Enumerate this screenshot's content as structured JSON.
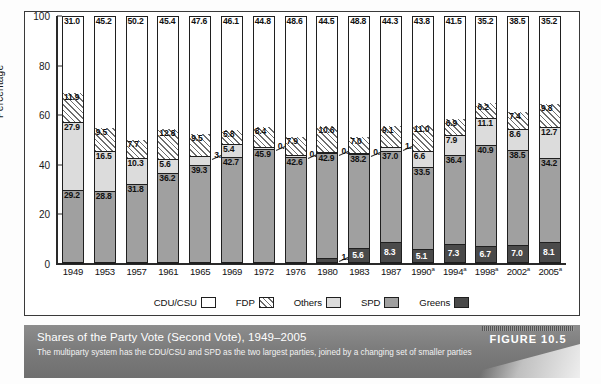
{
  "figure": {
    "tag": "FIGURE 10.5",
    "title": "Shares of the Party Vote (Second Vote), 1949–2005",
    "subtitle": "The multiparty system has the CDU/CSU and SPD as the two largest parties, joined by a changing set of smaller parties"
  },
  "axes": {
    "ylabel": "Percentage",
    "yticks": [
      "100",
      "80",
      "60",
      "40",
      "20",
      "0"
    ]
  },
  "legend": [
    {
      "label": "CDU/CSU",
      "key": "cdu",
      "color": "#ffffff"
    },
    {
      "label": "FDP",
      "key": "fdp",
      "color": "#ffffff"
    },
    {
      "label": "Others",
      "key": "others",
      "color": "#dcdcdc"
    },
    {
      "label": "SPD",
      "key": "spd",
      "color": "#a0a0a0"
    },
    {
      "label": "Greens",
      "key": "greens",
      "color": "#4a4a4a"
    }
  ],
  "chart_data": {
    "type": "bar",
    "subtype": "stacked-vertical-100",
    "title": "Shares of the Party Vote (Second Vote), 1949–2005",
    "xlabel": "",
    "ylabel": "Percentage",
    "ylim": [
      0,
      100
    ],
    "ytick_step": 20,
    "grid": false,
    "legend_position": "bottom",
    "footnote_marker": "a",
    "categories": [
      "1949",
      "1953",
      "1957",
      "1961",
      "1965",
      "1969",
      "1972",
      "1976",
      "1980",
      "1983",
      "1987",
      "1990",
      "1994",
      "1998",
      "2002",
      "2005"
    ],
    "categories_display": [
      "1949",
      "1953",
      "1957",
      "1961",
      "1965",
      "1969",
      "1972",
      "1976",
      "1980",
      "1983",
      "1987",
      "1990a",
      "1994a",
      "1998a",
      "2002a",
      "2005a"
    ],
    "stack_order_bottom_to_top": [
      "Greens",
      "SPD",
      "Others",
      "FDP",
      "CDU/CSU"
    ],
    "series": [
      {
        "name": "Greens",
        "values": [
          null,
          null,
          null,
          null,
          null,
          null,
          null,
          null,
          1.5,
          5.6,
          8.3,
          5.1,
          7.3,
          6.7,
          7.0,
          8.1
        ]
      },
      {
        "name": "SPD",
        "values": [
          29.2,
          28.8,
          31.8,
          36.2,
          39.3,
          42.7,
          45.9,
          42.6,
          42.9,
          38.2,
          37.0,
          33.5,
          36.4,
          40.9,
          38.5,
          34.2
        ]
      },
      {
        "name": "Others",
        "values": [
          27.9,
          16.5,
          10.3,
          5.6,
          3.6,
          5.4,
          0.9,
          0.9,
          0.5,
          0.4,
          1.3,
          6.6,
          7.9,
          11.1,
          8.6,
          12.7
        ]
      },
      {
        "name": "FDP",
        "values": [
          11.9,
          9.5,
          7.7,
          12.8,
          9.5,
          5.8,
          8.4,
          7.9,
          10.6,
          7.0,
          9.1,
          11.0,
          6.9,
          6.2,
          7.4,
          9.8
        ]
      },
      {
        "name": "CDU/CSU",
        "values": [
          31.0,
          45.2,
          50.2,
          45.4,
          47.6,
          46.1,
          44.8,
          48.6,
          44.5,
          48.8,
          44.3,
          43.8,
          41.5,
          35.2,
          38.5,
          35.2
        ]
      }
    ],
    "bars": [
      {
        "year": "1949",
        "year_display": "1949",
        "greens": null,
        "spd": 29.2,
        "others": 27.9,
        "fdp": 11.9,
        "cdu": 31.0
      },
      {
        "year": "1953",
        "year_display": "1953",
        "greens": null,
        "spd": 28.8,
        "others": 16.5,
        "fdp": 9.5,
        "cdu": 45.2
      },
      {
        "year": "1957",
        "year_display": "1957",
        "greens": null,
        "spd": 31.8,
        "others": 10.3,
        "fdp": 7.7,
        "cdu": 50.2
      },
      {
        "year": "1961",
        "year_display": "1961",
        "greens": null,
        "spd": 36.2,
        "others": 5.6,
        "fdp": 12.8,
        "cdu": 45.4
      },
      {
        "year": "1965",
        "year_display": "1965",
        "greens": null,
        "spd": 39.3,
        "others": 3.6,
        "fdp": 9.5,
        "cdu": 47.6
      },
      {
        "year": "1969",
        "year_display": "1969",
        "greens": null,
        "spd": 42.7,
        "others": 5.4,
        "fdp": 5.8,
        "cdu": 46.1
      },
      {
        "year": "1972",
        "year_display": "1972",
        "greens": null,
        "spd": 45.9,
        "others": 0.9,
        "fdp": 8.4,
        "cdu": 44.8
      },
      {
        "year": "1976",
        "year_display": "1976",
        "greens": null,
        "spd": 42.6,
        "others": 0.9,
        "fdp": 7.9,
        "cdu": 48.6
      },
      {
        "year": "1980",
        "year_display": "1980",
        "greens": 1.5,
        "spd": 42.9,
        "others": 0.5,
        "fdp": 10.6,
        "cdu": 44.5
      },
      {
        "year": "1983",
        "year_display": "1983",
        "greens": 5.6,
        "spd": 38.2,
        "others": 0.4,
        "fdp": 7.0,
        "cdu": 48.8
      },
      {
        "year": "1987",
        "year_display": "1987",
        "greens": 8.3,
        "spd": 37.0,
        "others": 1.3,
        "fdp": 9.1,
        "cdu": 44.3
      },
      {
        "year": "1990",
        "year_display": "1990a",
        "greens": 5.1,
        "spd": 33.5,
        "others": 6.6,
        "fdp": 11.0,
        "cdu": 43.8
      },
      {
        "year": "1994",
        "year_display": "1994a",
        "greens": 7.3,
        "spd": 36.4,
        "others": 7.9,
        "fdp": 6.9,
        "cdu": 41.5
      },
      {
        "year": "1998",
        "year_display": "1998a",
        "greens": 6.7,
        "spd": 40.9,
        "others": 11.1,
        "fdp": 6.2,
        "cdu": 35.2
      },
      {
        "year": "2002",
        "year_display": "2002a",
        "greens": 7.0,
        "spd": 38.5,
        "others": 8.6,
        "fdp": 7.4,
        "cdu": 38.5
      },
      {
        "year": "2005",
        "year_display": "2005a",
        "greens": 8.1,
        "spd": 34.2,
        "others": 12.7,
        "fdp": 9.8,
        "cdu": 35.2
      }
    ]
  }
}
